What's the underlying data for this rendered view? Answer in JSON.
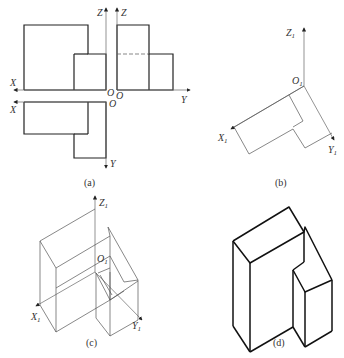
{
  "figure": {
    "panels": [
      {
        "id": "a",
        "caption": "(a)",
        "description": "Three-view orthographic projection",
        "axis_labels": {
          "x_front": "X",
          "z_front": "Z",
          "o_front": "O",
          "z_side": "Z",
          "o_side": "O",
          "y_side": "Y",
          "x_top": "X",
          "o_top": "O",
          "y_top": "Y"
        }
      },
      {
        "id": "b",
        "caption": "(b)",
        "description": "Isometric axes with top-view outline",
        "axis_labels": {
          "z": "Z",
          "x": "X",
          "y": "Y",
          "o": "O",
          "subscript": "1"
        }
      },
      {
        "id": "c",
        "caption": "(c)",
        "description": "Isometric construction lines",
        "axis_labels": {
          "z": "Z",
          "x": "X",
          "y": "Y",
          "o": "O",
          "subscript": "1"
        }
      },
      {
        "id": "d",
        "caption": "(d)",
        "description": "Finished isometric solid"
      }
    ]
  }
}
